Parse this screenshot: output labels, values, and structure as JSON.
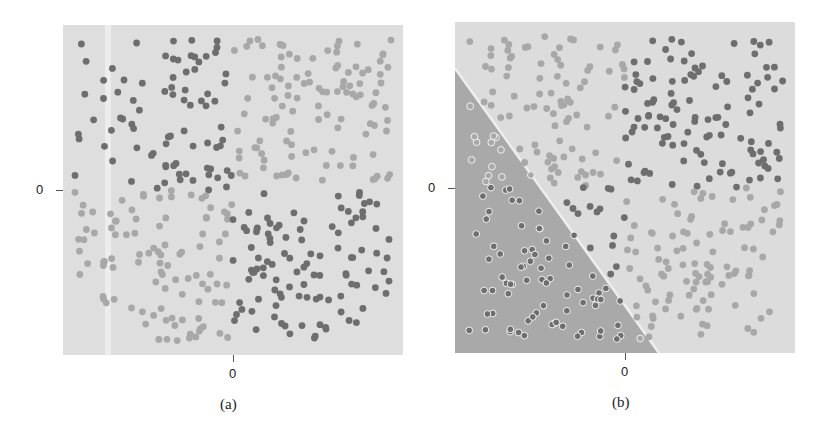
{
  "chart_data": [
    {
      "id": "a",
      "type": "scatter",
      "title": "",
      "caption": "(a)",
      "xlabel": "",
      "ylabel": "",
      "x_tick_labels": [
        "0"
      ],
      "y_tick_labels": [
        "0"
      ],
      "xlim": [
        -1,
        1
      ],
      "ylim": [
        -1,
        1
      ],
      "grid": false,
      "legend": "none",
      "background_color": "#dedede",
      "description": "XOR-style pattern: dark points in top-left and bottom-right quadrants, light points in top-right and bottom-left quadrants",
      "series": [
        {
          "name": "dark class",
          "color": "#6e6e6e",
          "quadrants": [
            "top-left",
            "bottom-right"
          ],
          "approx_count": 200
        },
        {
          "name": "light class",
          "color": "#a8a8a8",
          "quadrants": [
            "top-right",
            "bottom-left"
          ],
          "approx_count": 200
        }
      ]
    },
    {
      "id": "b",
      "type": "scatter",
      "title": "",
      "caption": "(b)",
      "xlabel": "",
      "ylabel": "",
      "x_tick_labels": [
        "0"
      ],
      "y_tick_labels": [
        "0"
      ],
      "xlim": [
        -1,
        1
      ],
      "ylim": [
        -1,
        1
      ],
      "grid": false,
      "legend": "none",
      "background_light": "#dcdcdc",
      "background_dark_region": "#a9a9a9",
      "decision_boundary": {
        "from": [
          -1,
          0.72
        ],
        "to": [
          0.2,
          -1
        ],
        "description": "linear boundary, lower-left region shaded darker"
      },
      "description": "Same XOR data with a linear decision boundary; lower-left triangle shaded dark",
      "series": [
        {
          "name": "dark class",
          "color": "#6e6e6e",
          "quadrants": [
            "top-right",
            "bottom-left"
          ],
          "approx_count": 200
        },
        {
          "name": "light class",
          "color": "#a8a8a8",
          "quadrants": [
            "top-left",
            "bottom-right"
          ],
          "approx_count": 200
        }
      ]
    }
  ],
  "panels": {
    "a": {
      "caption": "(a)",
      "x_zero": "0",
      "y_zero": "0"
    },
    "b": {
      "caption": "(b)",
      "x_zero": "0",
      "y_zero": "0"
    }
  }
}
